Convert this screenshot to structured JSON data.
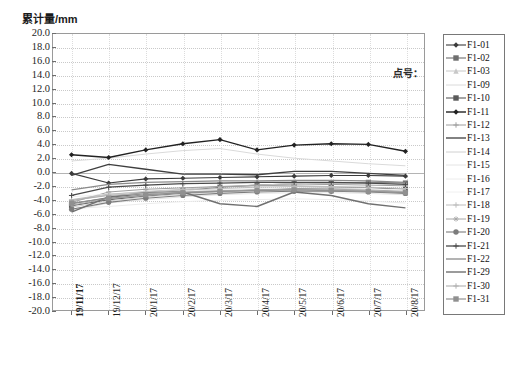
{
  "chart_data": {
    "type": "line",
    "title": "累计量/mm",
    "xlabel": "",
    "ylabel": "累计量/mm",
    "legend_title": "点号：",
    "legend_position": "right",
    "grid": true,
    "ylim": [
      -20.0,
      20.0
    ],
    "ytick_step": 2.0,
    "ytick_labels": [
      "20.0",
      "18.0",
      "16.0",
      "14.0",
      "12.0",
      "10.0",
      "8.0",
      "6.0",
      "4.0",
      "2.0",
      "0.0",
      "-2.0",
      "-4.0",
      "-6.0",
      "-8.0",
      "-10.0",
      "-12.0",
      "-14.0",
      "-16.0",
      "-18.0",
      "-20.0"
    ],
    "categories": [
      "19/11/17",
      "19/12/17",
      "20/1/17",
      "20/2/17",
      "20/3/17",
      "20/4/17",
      "20/5/17",
      "20/6/17",
      "20/7/17",
      "20/8/17"
    ],
    "series": [
      {
        "name": "F1-01",
        "marker": "diamond",
        "color": "#3b3b3b",
        "width": 1.1,
        "values": [
          -0.2,
          -1.6,
          -1.0,
          -0.9,
          -0.8,
          -0.7,
          -0.6,
          -0.5,
          -0.5,
          -0.6
        ]
      },
      {
        "name": "F1-02",
        "marker": "square",
        "color": "#6e6e6e",
        "width": 1.1,
        "values": [
          -4.6,
          -3.7,
          -3.1,
          -2.7,
          -2.2,
          -1.9,
          -1.7,
          -1.6,
          -1.5,
          -1.6
        ]
      },
      {
        "name": "F1-03",
        "marker": "triangle",
        "color": "#c8c8c8",
        "width": 1.0,
        "values": [
          -4.2,
          -3.3,
          -2.8,
          -2.5,
          -2.1,
          -1.9,
          -1.7,
          -1.6,
          -1.6,
          -1.7
        ]
      },
      {
        "name": "F1-09",
        "marker": "none",
        "color": "#dadada",
        "width": 1.0,
        "values": [
          1.6,
          2.0,
          2.6,
          3.1,
          3.4,
          2.6,
          2.0,
          1.6,
          1.2,
          0.9
        ]
      },
      {
        "name": "F1-10",
        "marker": "square",
        "color": "#5a5a5a",
        "width": 1.1,
        "values": [
          -4.9,
          -4.0,
          -3.5,
          -3.1,
          -2.8,
          -2.6,
          -2.4,
          -2.3,
          -2.3,
          -2.5
        ]
      },
      {
        "name": "F1-11",
        "marker": "diamond",
        "color": "#222222",
        "width": 1.4,
        "values": [
          2.5,
          2.1,
          3.2,
          4.1,
          4.7,
          3.2,
          3.9,
          4.1,
          4.0,
          3.0
        ]
      },
      {
        "name": "F1-12",
        "marker": "plus",
        "color": "#9e9e9e",
        "width": 1.0,
        "values": [
          -4.4,
          -2.9,
          -2.5,
          -2.3,
          -2.1,
          -2.0,
          -1.9,
          -1.8,
          -1.9,
          -2.0
        ]
      },
      {
        "name": "F1-13",
        "marker": "none",
        "color": "#3f3f3f",
        "width": 1.3,
        "values": [
          -0.5,
          1.1,
          0.4,
          -0.3,
          -0.3,
          -0.4,
          0.1,
          0.1,
          -0.2,
          -0.5
        ]
      },
      {
        "name": "F1-14",
        "marker": "none",
        "color": "#d0d0d0",
        "width": 1.0,
        "values": [
          -5.1,
          -4.2,
          -3.6,
          -3.2,
          -2.9,
          -2.7,
          -2.6,
          -2.6,
          -2.7,
          -2.9
        ]
      },
      {
        "name": "F1-15",
        "marker": "none",
        "color": "#e4e4e4",
        "width": 1.0,
        "values": [
          -5.6,
          -4.5,
          -4.0,
          -3.6,
          -3.3,
          -3.1,
          -3.0,
          -3.0,
          -3.1,
          -3.3
        ]
      },
      {
        "name": "F1-16",
        "marker": "none",
        "color": "#ececec",
        "width": 1.0,
        "values": [
          -5.3,
          -5.0,
          -4.6,
          -4.3,
          -4.1,
          -4.0,
          -3.9,
          -4.0,
          -4.2,
          -4.5
        ]
      },
      {
        "name": "F1-17",
        "marker": "none",
        "color": "#f0f0f0",
        "width": 1.0,
        "values": [
          -3.6,
          -3.2,
          -2.9,
          -2.7,
          -2.5,
          -2.4,
          -2.3,
          -2.3,
          -2.4,
          -2.6
        ]
      },
      {
        "name": "F1-18",
        "marker": "plus",
        "color": "#bdbdbd",
        "width": 1.0,
        "values": [
          -4.0,
          -3.2,
          -2.9,
          -2.6,
          -2.4,
          -2.2,
          -2.1,
          -2.1,
          -2.2,
          -2.4
        ]
      },
      {
        "name": "F1-19",
        "marker": "star",
        "color": "#a6a6a6",
        "width": 1.0,
        "values": [
          -4.8,
          -3.9,
          -3.4,
          -3.0,
          -2.8,
          -2.6,
          -2.5,
          -2.5,
          -2.6,
          -2.8
        ]
      },
      {
        "name": "F1-20",
        "marker": "circle",
        "color": "#7c7c7c",
        "width": 1.1,
        "values": [
          -5.4,
          -4.4,
          -3.8,
          -3.4,
          -3.1,
          -2.9,
          -2.8,
          -2.8,
          -2.9,
          -3.1
        ]
      },
      {
        "name": "F1-21",
        "marker": "plus",
        "color": "#4a4a4a",
        "width": 1.3,
        "values": [
          -3.4,
          -2.2,
          -1.9,
          -1.7,
          -1.6,
          -1.5,
          -1.5,
          -1.5,
          -1.6,
          -1.8
        ]
      },
      {
        "name": "F1-22",
        "marker": "none",
        "color": "#8a8a8a",
        "width": 1.3,
        "values": [
          -2.6,
          -1.8,
          -1.5,
          -1.4,
          -1.3,
          -1.3,
          -1.2,
          -1.2,
          -1.3,
          -1.5
        ]
      },
      {
        "name": "F1-29",
        "marker": "none",
        "color": "#707070",
        "width": 1.4,
        "values": [
          -5.8,
          -3.6,
          -3.0,
          -2.9,
          -4.6,
          -5.0,
          -2.9,
          -3.4,
          -4.6,
          -5.2
        ]
      },
      {
        "name": "F1-30",
        "marker": "plus",
        "color": "#b0b0b0",
        "width": 1.1,
        "values": [
          -4.1,
          -3.4,
          -3.1,
          -2.9,
          -2.7,
          -2.6,
          -2.5,
          -2.6,
          -2.7,
          -2.9
        ]
      },
      {
        "name": "F1-31",
        "marker": "square",
        "color": "#909090",
        "width": 1.2,
        "values": [
          -4.5,
          -3.8,
          -3.3,
          -3.0,
          -2.8,
          -2.7,
          -2.6,
          -2.7,
          -2.8,
          -3.0
        ]
      }
    ]
  }
}
